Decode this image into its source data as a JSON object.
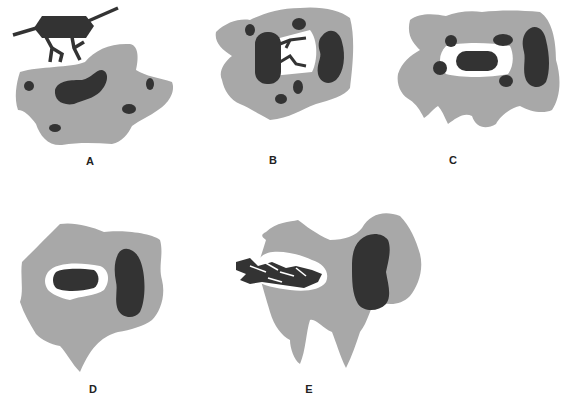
{
  "figure": {
    "colors": {
      "cytoplasm": "#a8a8a8",
      "nucleus": "#333333",
      "vacuole": "#ffffff",
      "background": "#ffffff"
    },
    "panels": [
      {
        "id": "A",
        "label": "A",
        "description": "Bacterium with pili attaching to phagocyte surface"
      },
      {
        "id": "B",
        "label": "B",
        "description": "Pseudopods extend around bacterium"
      },
      {
        "id": "C",
        "label": "C",
        "description": "Bacterium enclosed in phagosome; granules approach"
      },
      {
        "id": "D",
        "label": "D",
        "description": "Phagolysosome; bacterium being digested"
      },
      {
        "id": "E",
        "label": "E",
        "description": "Bacterium fragmented within vacuole"
      }
    ]
  }
}
